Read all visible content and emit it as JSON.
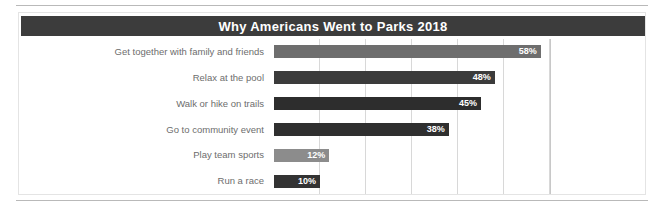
{
  "chart_data": {
    "type": "bar",
    "orientation": "horizontal",
    "title": "Why Americans Went to Parks 2018",
    "xlabel": "",
    "ylabel": "",
    "xlim": [
      0,
      60
    ],
    "grid": true,
    "gridlines": [
      10,
      20,
      30,
      40,
      50,
      60
    ],
    "legend": null,
    "value_suffix": "%",
    "categories": [
      "Get together with family and friends",
      "Relax at the pool",
      "Walk or hike on trails",
      "Go to community event",
      "Play team sports",
      "Run a race"
    ],
    "values": [
      58,
      48,
      45,
      38,
      12,
      10
    ],
    "value_labels": [
      "58%",
      "48%",
      "45%",
      "38%",
      "12%",
      "10%"
    ],
    "bar_colors": [
      "#6e6e6e",
      "#3b3b3b",
      "#2d2d2d",
      "#2f2f2f",
      "#8c8c8c",
      "#333333"
    ]
  },
  "header": {
    "title": "Why Americans Went to Parks 2018",
    "background": "#3c3c3c",
    "text_color": "#ffffff"
  },
  "colors": {
    "page_background": "#ffffff",
    "card_border": "#e4e4e4",
    "rule": "#b9b9b9",
    "gridline": "#d8d8d8",
    "axis_line": "#c8c8c8",
    "label_text": "#6d6d6d"
  }
}
